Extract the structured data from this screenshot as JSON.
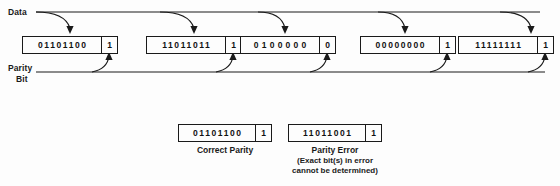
{
  "diagram": {
    "labels": {
      "data": "Data",
      "parity_line1": "Parity",
      "parity_line2": "Bit"
    },
    "frames": [
      {
        "data_bits": "01101100",
        "parity_bit": "1"
      },
      {
        "data_bits": "11011011",
        "parity_bit": "1"
      },
      {
        "data_bits": "0100000",
        "parity_bit": "0"
      },
      {
        "data_bits": "00000000",
        "parity_bit": "1"
      },
      {
        "data_bits": "11111111",
        "parity_bit": "1"
      }
    ],
    "examples": [
      {
        "data_bits": "01101100",
        "parity_bit": "1",
        "caption_line1": "Correct Parity",
        "caption_line2": "",
        "caption_line3": ""
      },
      {
        "data_bits": "11011001",
        "parity_bit": "1",
        "caption_line1": "Parity Error",
        "caption_line2": "(Exact bit(s) in error",
        "caption_line3": "cannot be determined)"
      }
    ],
    "colors": {
      "ink": "#1a1a1a",
      "background": "#fdfdfd"
    }
  }
}
